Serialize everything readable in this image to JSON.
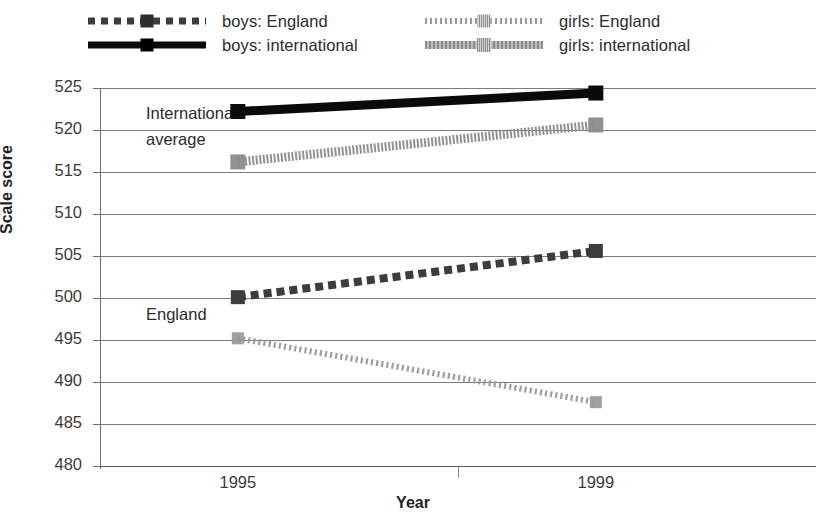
{
  "chart_data": {
    "type": "line",
    "title": "",
    "subtitle": "",
    "xlabel": "Year",
    "ylabel": "Scale score",
    "categories": [
      "1995",
      "1999"
    ],
    "x": [
      1995,
      1999
    ],
    "ylim": [
      480,
      525
    ],
    "yticks": [
      480,
      485,
      490,
      495,
      500,
      505,
      510,
      515,
      520,
      525
    ],
    "ytick_labels": [
      "480",
      "485",
      "490",
      "495",
      "500",
      "505",
      "510",
      "515",
      "520",
      "525"
    ],
    "grid": "horizontal",
    "legend_position": "top",
    "series": [
      {
        "name": "boys: England",
        "values": [
          500.1,
          505.6
        ],
        "color": "#3d3d3d",
        "style": "dashed",
        "marker": "square",
        "group": "England"
      },
      {
        "name": "boys: international",
        "values": [
          522.2,
          524.4
        ],
        "color": "#0a0a0a",
        "style": "solid",
        "marker": "square",
        "group": "International average"
      },
      {
        "name": "girls: England",
        "values": [
          495.2,
          487.6
        ],
        "color": "#9a9a9a",
        "style": "dotted",
        "marker": "square",
        "group": "England"
      },
      {
        "name": "girls: international",
        "values": [
          516.2,
          520.6
        ],
        "color": "#8c8c8c",
        "style": "hatched",
        "marker": "square",
        "group": "International average"
      }
    ],
    "annotations": [
      {
        "text": "International average",
        "at_category": "1995",
        "at_value": 521.5
      },
      {
        "text": "average",
        "at_category": "1995",
        "at_value": 518.0
      },
      {
        "text": "England",
        "at_category": "1995",
        "at_value": 497.0
      }
    ]
  },
  "legend": {
    "items": [
      {
        "label": "boys: England"
      },
      {
        "label": "boys: international"
      },
      {
        "label": "girls: England"
      },
      {
        "label": "girls: international"
      }
    ]
  },
  "annotations": {
    "international_line1": "International",
    "international_line2": "average",
    "england": "England"
  },
  "axes": {
    "x_title": "Year",
    "y_title": "Scale score",
    "x_categories": [
      "1995",
      "1999"
    ],
    "y_labels": [
      "525",
      "520",
      "515",
      "510",
      "505",
      "500",
      "495",
      "490",
      "485",
      "480"
    ]
  }
}
